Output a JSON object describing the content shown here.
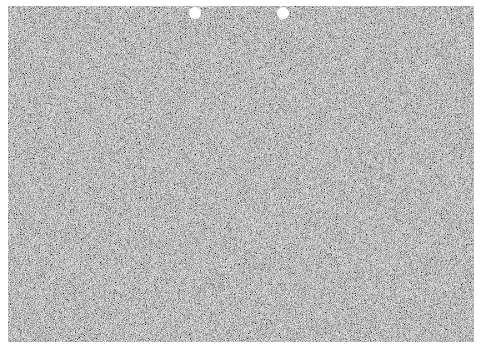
{
  "image": {
    "description": "Gray noise-textured sheet with two white punch holes at top",
    "canvas": {
      "width": 482,
      "height": 354,
      "background": "#ffffff"
    },
    "sheet": {
      "x": 8,
      "y": 6,
      "width": 466,
      "height": 336,
      "base_color": "#8c8c8c",
      "texture": "random-grain-noise"
    },
    "holes": [
      {
        "cx": 195,
        "cy": 13,
        "r": 6,
        "color": "#ffffff"
      },
      {
        "cx": 283,
        "cy": 13,
        "r": 6,
        "color": "#ffffff"
      }
    ]
  }
}
